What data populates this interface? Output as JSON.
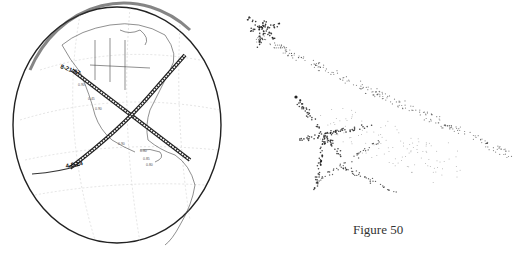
{
  "figure": {
    "caption": "Figure 50",
    "left_panel": {
      "type": "globe-map",
      "description": "Orthographic globe of North and Central America with two crossing solar eclipse totality paths",
      "paths": [
        {
          "label": "8-21-17"
        },
        {
          "label": "4-8-24"
        }
      ],
      "small_labels": [
        "0.90",
        "0.45",
        "0.90",
        "0.90",
        "0.80",
        "0.85",
        "0.80",
        "0.70"
      ]
    },
    "right_panel": {
      "type": "dot-pattern",
      "description": "Two stippled dot renderings: an upper elongated star-shaped streak and a lower larger star-shaped cluster with dispersing trail"
    }
  }
}
